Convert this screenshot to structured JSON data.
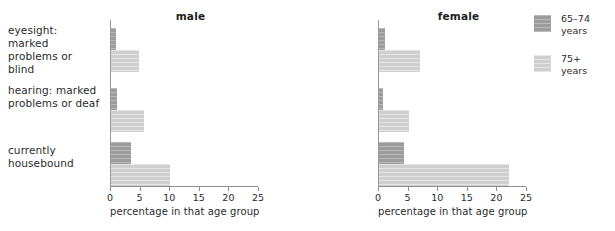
{
  "chart_data": {
    "type": "bar",
    "orientation": "horizontal",
    "title": "",
    "xlabel": "percentage in that age group",
    "ylabel": "",
    "xlim": [
      0,
      25
    ],
    "xticks": [
      0,
      5,
      10,
      15,
      20,
      25
    ],
    "xtick_labels": [
      "0",
      "5",
      "10",
      "15",
      "20",
      "25"
    ],
    "grid": false,
    "legend_position": "right",
    "categories": [
      "eyesight: marked\nproblems or blind",
      "hearing: marked\nproblems or deaf",
      "currently\nhousebound"
    ],
    "panels": [
      {
        "title": "male",
        "series": [
          {
            "name": "65–74 years",
            "values": [
              0.8,
              1.0,
              3.3
            ]
          },
          {
            "name": "75+ years",
            "values": [
              4.8,
              5.5,
              10.0
            ]
          }
        ]
      },
      {
        "title": "female",
        "series": [
          {
            "name": "65–74 years",
            "values": [
              1.0,
              0.7,
              4.2
            ]
          },
          {
            "name": "75+ years",
            "values": [
              7.0,
              5.0,
              22.0
            ]
          }
        ]
      }
    ],
    "legend": [
      {
        "label": "65–74\nyears",
        "color": "#9c9c9c"
      },
      {
        "label": "75+\nyears",
        "color": "#cfcfcf"
      }
    ],
    "colors": {
      "series_65_74": "#9c9c9c",
      "series_75_plus": "#cfcfcf",
      "axis": "#8f8f8f",
      "text": "#2b2b2b",
      "background": "#ffffff"
    }
  },
  "categories": {
    "c0": "eyesight: marked\nproblems or blind",
    "c1": "hearing: marked\nproblems or deaf",
    "c2": "currently\nhousebound"
  },
  "male": {
    "title": "male",
    "axis_title": "percentage in that age group",
    "ticks": {
      "t0": "0",
      "t1": "5",
      "t2": "10",
      "t3": "15",
      "t4": "20",
      "t5": "25"
    }
  },
  "female": {
    "title": "female",
    "axis_title": "percentage in that age group",
    "ticks": {
      "t0": "0",
      "t1": "5",
      "t2": "10",
      "t3": "15",
      "t4": "20",
      "t5": "25"
    }
  },
  "legend": {
    "item0": "65–74\nyears",
    "item1": "75+\nyears"
  }
}
